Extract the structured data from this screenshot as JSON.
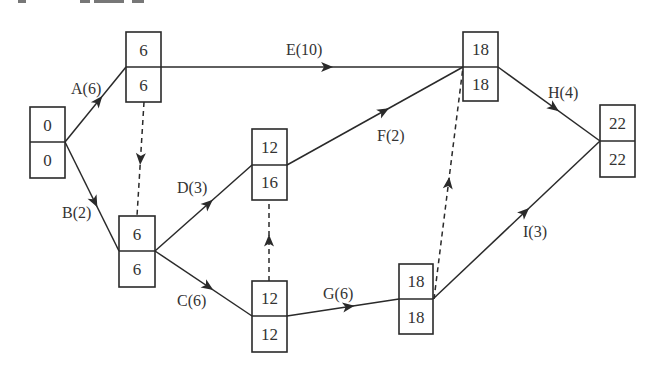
{
  "diagram": {
    "type": "activity-on-arrow network (critical path)",
    "nodes": [
      {
        "id": "n1",
        "top": "0",
        "bottom": "0",
        "x": 30,
        "y": 107,
        "w": 35,
        "h": 71
      },
      {
        "id": "n2",
        "top": "6",
        "bottom": "6",
        "x": 126,
        "y": 32,
        "w": 35,
        "h": 70
      },
      {
        "id": "n3",
        "top": "6",
        "bottom": "6",
        "x": 119,
        "y": 216,
        "w": 36,
        "h": 71
      },
      {
        "id": "n4",
        "top": "12",
        "bottom": "16",
        "x": 252,
        "y": 129,
        "w": 35,
        "h": 71
      },
      {
        "id": "n5",
        "top": "12",
        "bottom": "12",
        "x": 252,
        "y": 281,
        "w": 35,
        "h": 71
      },
      {
        "id": "n6",
        "top": "18",
        "bottom": "18",
        "x": 463,
        "y": 32,
        "w": 35,
        "h": 69
      },
      {
        "id": "n7",
        "top": "18",
        "bottom": "18",
        "x": 399,
        "y": 264,
        "w": 34,
        "h": 70
      },
      {
        "id": "n8",
        "top": "22",
        "bottom": "22",
        "x": 600,
        "y": 105,
        "w": 35,
        "h": 72
      }
    ],
    "activities": [
      {
        "id": "A",
        "label": "A(6)",
        "from": "n1",
        "to": "n2",
        "duration": 6,
        "dashed": false
      },
      {
        "id": "B",
        "label": "B(2)",
        "from": "n1",
        "to": "n3",
        "duration": 2,
        "dashed": false
      },
      {
        "id": "E",
        "label": "E(10)",
        "from": "n2",
        "to": "n6",
        "duration": 10,
        "dashed": false
      },
      {
        "id": "D",
        "label": "D(3)",
        "from": "n3",
        "to": "n4",
        "duration": 3,
        "dashed": false
      },
      {
        "id": "C",
        "label": "C(6)",
        "from": "n3",
        "to": "n5",
        "duration": 6,
        "dashed": false
      },
      {
        "id": "F",
        "label": "F(2)",
        "from": "n4",
        "to": "n6",
        "duration": 2,
        "dashed": false
      },
      {
        "id": "G",
        "label": "G(6)",
        "from": "n5",
        "to": "n7",
        "duration": 6,
        "dashed": false
      },
      {
        "id": "H",
        "label": "H(4)",
        "from": "n6",
        "to": "n8",
        "duration": 4,
        "dashed": false
      },
      {
        "id": "I",
        "label": "I(3)",
        "from": "n7",
        "to": "n8",
        "duration": 3,
        "dashed": false
      },
      {
        "id": "dummy1",
        "label": "",
        "from": "n2",
        "to": "n3",
        "dashed": true
      },
      {
        "id": "dummy2",
        "label": "",
        "from": "n5",
        "to": "n4",
        "dashed": true
      },
      {
        "id": "dummy3",
        "label": "",
        "from": "n7",
        "to": "n6",
        "dashed": true
      }
    ],
    "labels": {
      "A": "A(6)",
      "B": "B(2)",
      "C": "C(6)",
      "D": "D(3)",
      "E": "E(10)",
      "F": "F(2)",
      "G": "G(6)",
      "H": "H(4)",
      "I": "I(3)"
    },
    "node_values": {
      "n1": {
        "top": "0",
        "bottom": "0"
      },
      "n2": {
        "top": "6",
        "bottom": "6"
      },
      "n3": {
        "top": "6",
        "bottom": "6"
      },
      "n4": {
        "top": "12",
        "bottom": "16"
      },
      "n5": {
        "top": "12",
        "bottom": "12"
      },
      "n6": {
        "top": "18",
        "bottom": "18"
      },
      "n7": {
        "top": "18",
        "bottom": "18"
      },
      "n8": {
        "top": "22",
        "bottom": "22"
      }
    },
    "colors": {
      "stroke": "#2a2a2a",
      "text": "#333333",
      "background": "#ffffff"
    }
  }
}
